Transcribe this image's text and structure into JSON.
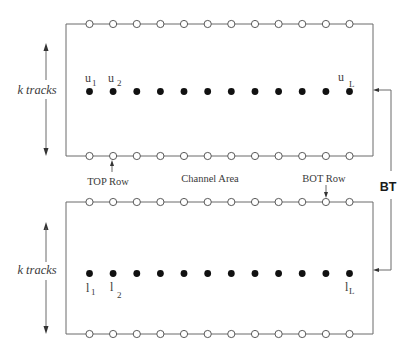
{
  "diagram": {
    "type": "channel-routing-layout",
    "colors": {
      "line": "#6a6a6a",
      "pin_fill": "#ffffff",
      "cell_fill": "#111111",
      "text": "#3a3a3a"
    },
    "labels": {
      "k_tracks_top": "k tracks",
      "k_tracks_bottom": "k tracks",
      "top_row": "TOP Row",
      "channel_area": "Channel Area",
      "bot_row": "BOT Row",
      "bt": "BT"
    },
    "top_block": {
      "pins_per_row": 12,
      "cells": 12,
      "cell_labels": [
        {
          "base": "u",
          "sub": "1"
        },
        {
          "base": "u",
          "sub": "2"
        },
        {
          "base": "u",
          "sub": "L"
        }
      ]
    },
    "bottom_block": {
      "pins_per_row": 12,
      "cells": 12,
      "cell_labels": [
        {
          "base": "l",
          "sub": "1"
        },
        {
          "base": "l",
          "sub": "2"
        },
        {
          "base": "l",
          "sub": "L"
        }
      ]
    }
  }
}
